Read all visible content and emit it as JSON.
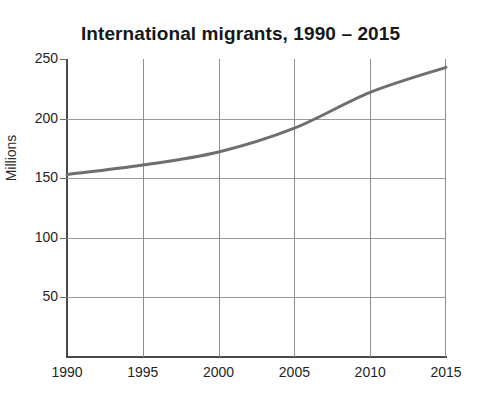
{
  "chart_data": {
    "type": "line",
    "title": "International migrants, 1990 – 2015",
    "xlabel": "",
    "ylabel": "Millions",
    "x": [
      1990,
      1995,
      2000,
      2005,
      2010,
      2015
    ],
    "categories": [
      "1990",
      "1995",
      "2000",
      "2005",
      "2010",
      "2015"
    ],
    "values": [
      153,
      161,
      172,
      192,
      222,
      243
    ],
    "series": [
      {
        "name": "International migrants",
        "values": [
          153,
          161,
          172,
          192,
          222,
          243
        ]
      }
    ],
    "xlim": [
      1990,
      2015
    ],
    "ylim": [
      0,
      250
    ],
    "ytick_labels": [
      "250",
      "200",
      "150",
      "100",
      "50"
    ],
    "ytick_values": [
      250,
      200,
      150,
      100,
      50
    ],
    "xtick_labels": [
      "1990",
      "1995",
      "2000",
      "2005",
      "2010",
      "2015"
    ],
    "grid": "both",
    "legend": "none",
    "line_color": "#6e6e6e",
    "line_width": 3,
    "markers": "none",
    "background_color": "#ffffff",
    "axis_color": "#4a4a4a",
    "gridline_color": "#9a9a9a",
    "title_color": "#15171a"
  }
}
